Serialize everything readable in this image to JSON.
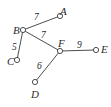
{
  "figure": {
    "type": "weighted-graph",
    "background_color": "#ffffff",
    "stroke_color": "#3a3a3a",
    "text_color": "#2b2b2b",
    "node_fill": "#ffffff",
    "node_radius": 2.6
  },
  "graph_data": {
    "type": "graph",
    "title": "",
    "directed": false,
    "weighted": true,
    "nodes": [
      {
        "id": "A",
        "label": "A",
        "x": 60,
        "y": 16,
        "label_x": 60,
        "label_y": 6
      },
      {
        "id": "B",
        "label": "B",
        "x": 23,
        "y": 30,
        "label_x": 13,
        "label_y": 25
      },
      {
        "id": "C",
        "label": "C",
        "x": 17,
        "y": 60,
        "label_x": 7,
        "label_y": 56
      },
      {
        "id": "D",
        "label": "D",
        "x": 35,
        "y": 82,
        "label_x": 31,
        "label_y": 89
      },
      {
        "id": "E",
        "label": "E",
        "x": 96,
        "y": 50,
        "label_x": 101,
        "label_y": 44
      },
      {
        "id": "F",
        "label": "F",
        "x": 60,
        "y": 51,
        "label_x": 58,
        "label_y": 38
      }
    ],
    "edges": [
      {
        "source": "B",
        "target": "A",
        "weight": "7",
        "label_x": 34,
        "label_y": 13
      },
      {
        "source": "B",
        "target": "C",
        "weight": "5",
        "label_x": 12,
        "label_y": 43
      },
      {
        "source": "B",
        "target": "F",
        "weight": "7",
        "label_x": 41,
        "label_y": 31
      },
      {
        "source": "F",
        "target": "D",
        "weight": "6",
        "label_x": 37,
        "label_y": 62
      },
      {
        "source": "F",
        "target": "E",
        "weight": "9",
        "label_x": 77,
        "label_y": 41
      }
    ]
  }
}
